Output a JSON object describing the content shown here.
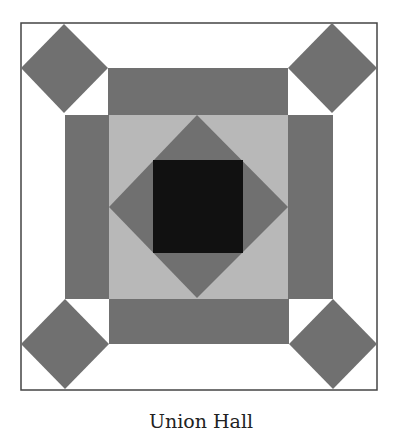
{
  "caption": "Union Hall",
  "colors": {
    "background": "#ffffff",
    "border": "#444444",
    "dark_gray": "#707070",
    "light_gray": "#b8b8b8",
    "black": "#111111"
  },
  "block": {
    "border": {
      "x": 21,
      "y": 23,
      "w": 356,
      "h": 367
    },
    "corner_diamonds": [
      {
        "position": "top-left",
        "cx": 64,
        "cy": 68,
        "r": 44
      },
      {
        "position": "top-right",
        "cx": 332,
        "cy": 68,
        "r": 44
      },
      {
        "position": "bottom-left",
        "cx": 65,
        "cy": 344,
        "r": 44
      },
      {
        "position": "bottom-right",
        "cx": 333,
        "cy": 344,
        "r": 44
      }
    ],
    "bands": [
      {
        "position": "top",
        "x": 108,
        "y": 68,
        "w": 180,
        "h": 47
      },
      {
        "position": "bottom",
        "x": 109,
        "y": 299,
        "w": 180,
        "h": 45
      },
      {
        "position": "left",
        "x": 65,
        "y": 115,
        "w": 44,
        "h": 184
      },
      {
        "position": "right",
        "x": 288,
        "y": 115,
        "w": 45,
        "h": 184
      }
    ],
    "center_square": {
      "x": 108,
      "y": 114,
      "w": 180,
      "h": 185
    },
    "center_diamond": {
      "top": [
        197,
        115
      ],
      "right": [
        288,
        207
      ],
      "bottom": [
        197,
        298
      ],
      "left": [
        109,
        207
      ]
    },
    "core_square": {
      "x": 153,
      "y": 160,
      "w": 90,
      "h": 93
    }
  }
}
